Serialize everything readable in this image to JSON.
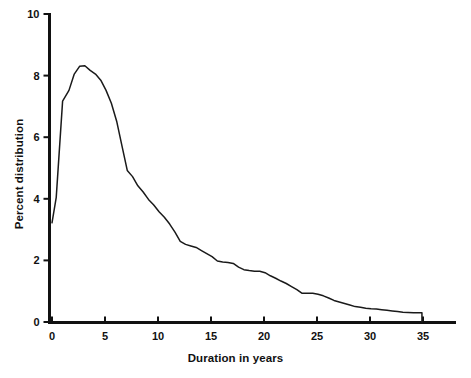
{
  "chart_data": {
    "type": "line",
    "title": "",
    "xlabel": "Duration in years",
    "ylabel": "Percent distribution",
    "xlim": [
      0,
      38.8
    ],
    "ylim": [
      0,
      10
    ],
    "grid": false,
    "legend": null,
    "line_color": "#1a1a1a",
    "xticks": [
      0,
      5,
      10,
      15,
      20,
      25,
      30,
      35
    ],
    "xtick_labels": [
      "0",
      "5",
      "10",
      "15",
      "20",
      "25",
      "30",
      "35"
    ],
    "yticks": [
      0,
      2,
      4,
      6,
      8,
      10
    ],
    "ytick_labels": [
      "0",
      "2",
      "4",
      "6",
      "8",
      "10"
    ],
    "series": [
      {
        "name": "Percent distribution by duration",
        "x": [
          0.0,
          0.4,
          1.0,
          1.6,
          2.1,
          2.6,
          3.1,
          3.6,
          4.1,
          4.6,
          5.1,
          5.6,
          6.1,
          6.6,
          7.1,
          7.6,
          8.1,
          8.6,
          9.1,
          9.6,
          10.1,
          10.6,
          11.1,
          11.6,
          12.1,
          12.6,
          13.1,
          13.6,
          14.1,
          14.6,
          15.1,
          15.6,
          16.1,
          16.6,
          17.1,
          17.6,
          18.1,
          18.6,
          19.1,
          19.6,
          20.1,
          20.6,
          21.1,
          21.6,
          22.1,
          22.6,
          23.1,
          23.6,
          24.1,
          24.6,
          25.1,
          25.6,
          26.1,
          26.6,
          27.1,
          27.6,
          28.1,
          28.6,
          29.1,
          29.6,
          30.1,
          30.6,
          31.1,
          31.6,
          32.1,
          32.6,
          33.1,
          34.1,
          34.9,
          34.9
        ],
        "y": [
          3.22,
          4.05,
          7.17,
          7.52,
          8.05,
          8.3,
          8.32,
          8.17,
          8.05,
          7.85,
          7.52,
          7.1,
          6.52,
          5.72,
          4.92,
          4.72,
          4.42,
          4.22,
          3.98,
          3.8,
          3.58,
          3.4,
          3.18,
          2.92,
          2.62,
          2.52,
          2.47,
          2.42,
          2.32,
          2.22,
          2.12,
          1.98,
          1.95,
          1.93,
          1.9,
          1.78,
          1.7,
          1.67,
          1.65,
          1.65,
          1.6,
          1.5,
          1.42,
          1.33,
          1.25,
          1.15,
          1.05,
          0.93,
          0.93,
          0.93,
          0.9,
          0.85,
          0.78,
          0.7,
          0.65,
          0.6,
          0.55,
          0.5,
          0.48,
          0.45,
          0.43,
          0.42,
          0.4,
          0.38,
          0.36,
          0.34,
          0.32,
          0.3,
          0.3,
          0.0
        ]
      }
    ],
    "annotations": []
  },
  "axes": {
    "x_title": "Duration in years",
    "y_title": "Percent distribution"
  }
}
